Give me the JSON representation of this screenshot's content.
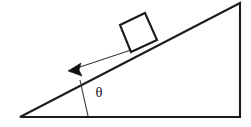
{
  "diagram": {
    "background_color": "#ffffff",
    "line_color": "#1c1c1c",
    "arrow_color": "#111111",
    "width": 251,
    "height": 127,
    "labels": {
      "angle_symbol": "θ"
    },
    "ramp": {
      "name": "inclined-plane",
      "shape": "right-triangle",
      "points": "20,117 240,117 240,3",
      "incline_from": [
        20,
        117
      ],
      "incline_to": [
        240,
        3
      ],
      "base_from": [
        20,
        117
      ],
      "base_to": [
        240,
        117
      ],
      "vertical_from": [
        240,
        117
      ],
      "vertical_to": [
        240,
        3
      ],
      "incline_angle_degrees": 27.4,
      "stroke_width": 2.1
    },
    "block": {
      "name": "sliding-block",
      "shape": "rotated-square",
      "points": "120,25 145,13 157,40 131,52",
      "fill": "#ffffff",
      "stroke_width": 2.1
    },
    "motion_arrow": {
      "name": "motion-direction-arrow",
      "shaft_from": [
        131,
        50
      ],
      "shaft_to": [
        76,
        68
      ],
      "head_points": "68,71 81,63 79,70 82,76",
      "direction": "down-the-incline",
      "stroke_width": 1.15
    },
    "angle_marker": {
      "name": "angle-reference-line",
      "from": [
        88,
        116
      ],
      "to": [
        80,
        80
      ],
      "label_x": 99,
      "label_y": 97,
      "stroke_width": 1.15
    }
  }
}
